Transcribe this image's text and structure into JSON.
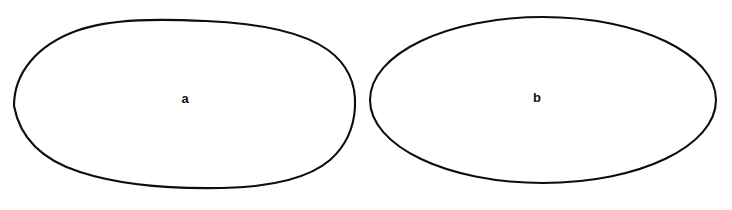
{
  "figure": {
    "background_color": "#ffffff",
    "stroke_color": "#0d0d0d",
    "label_color": "#111111",
    "width": 732,
    "height": 210,
    "shapes": [
      {
        "id": "shape-a",
        "label": "a",
        "kind": "irregular-oval",
        "description": "Hand-drawn irregular oval, flattened near-vertical right edge",
        "label_x": 185,
        "label_y": 100,
        "label_font_size": 13,
        "stroke_width": 2.1,
        "bounds": {
          "left": 14,
          "top": 19,
          "right": 356,
          "bottom": 188
        },
        "path": "M 14 106 C 14 72 38 45 76 31 C 112 18 162 19 206 21 C 252 23 300 30 328 50 C 350 66 356 88 355 107 C 354 126 347 145 330 160 C 308 179 268 187 222 188 C 172 189 120 185 80 172 C 42 160 20 138 14 106 Z"
      },
      {
        "id": "shape-b",
        "label": "b",
        "kind": "regular-ellipse",
        "description": "Smooth regular ellipse",
        "label_x": 537,
        "label_y": 99,
        "label_font_size": 13,
        "stroke_width": 2.1,
        "bounds": {
          "left": 370,
          "top": 17,
          "right": 716,
          "bottom": 183
        },
        "path": "M 370 100 C 370 54 447 17 543 17 C 639 17 716 54 716 100 C 716 146 639 183 543 183 C 447 183 370 146 370 100 Z"
      }
    ]
  }
}
